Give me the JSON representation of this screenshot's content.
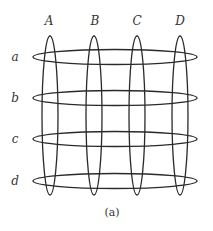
{
  "diagram": {
    "caption": "(a)",
    "column_labels": [
      "A",
      "B",
      "C",
      "D"
    ],
    "row_labels": [
      "a",
      "b",
      "c",
      "d"
    ],
    "stroke_color": "#2a2a2a",
    "text_color": "#333333",
    "columns": [
      {
        "label": "A",
        "cx": 50,
        "cy": 115.5,
        "rx": 8,
        "ry": 79.5
      },
      {
        "label": "B",
        "cx": 94,
        "cy": 115.5,
        "rx": 8,
        "ry": 79.5
      },
      {
        "label": "C",
        "cx": 137,
        "cy": 115.5,
        "rx": 8,
        "ry": 79.5
      },
      {
        "label": "D",
        "cx": 180,
        "cy": 115.5,
        "rx": 8,
        "ry": 79.5
      }
    ],
    "rows": [
      {
        "label": "a",
        "cx": 115,
        "cy": 57,
        "rx": 82,
        "ry": 7.5
      },
      {
        "label": "b",
        "cx": 115,
        "cy": 98,
        "rx": 82,
        "ry": 7.5
      },
      {
        "label": "c",
        "cx": 115,
        "cy": 139,
        "rx": 82,
        "ry": 7.5
      },
      {
        "label": "d",
        "cx": 115,
        "cy": 181,
        "rx": 82,
        "ry": 7.5
      }
    ]
  }
}
